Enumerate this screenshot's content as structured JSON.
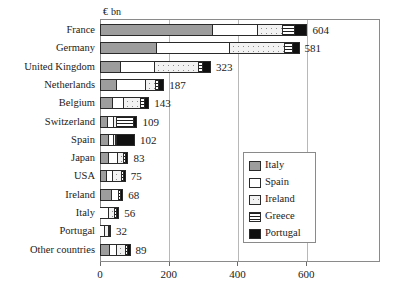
{
  "chart_data": {
    "type": "bar",
    "orientation": "horizontal",
    "stacked": true,
    "title": "",
    "units_label": "€ bn",
    "xlabel": "",
    "ylabel": "",
    "xlim": [
      0,
      815
    ],
    "xticks": [
      0,
      200,
      400,
      600
    ],
    "xtick_labels": [
      "0",
      "200",
      "400",
      "600"
    ],
    "grid": "vertical",
    "legend_position": "right-middle",
    "categories": [
      "France",
      "Germany",
      "United Kingdom",
      "Netherlands",
      "Belgium",
      "Switzerland",
      "Spain",
      "Japan",
      "USA",
      "Ireland",
      "Italy",
      "Portugal",
      "Other countries"
    ],
    "totals": [
      604,
      581,
      323,
      187,
      143,
      109,
      102,
      83,
      75,
      68,
      56,
      32,
      89
    ],
    "total_labels": [
      "604",
      "581",
      "323",
      "187",
      "143",
      "109",
      "102",
      "83",
      "75",
      "68",
      "56",
      "32",
      "89"
    ],
    "series": [
      {
        "name": "Italy",
        "fill": "solid-grey",
        "color": "#9d9d9d",
        "values": [
          330,
          166,
          62,
          50,
          37,
          23,
          27,
          27,
          19,
          36,
          0,
          0,
          29
        ]
      },
      {
        "name": "Spain",
        "fill": "white",
        "color": "#ffffff",
        "values": [
          130,
          212,
          97,
          85,
          32,
          19,
          14,
          26,
          19,
          20,
          25,
          14,
          20
        ]
      },
      {
        "name": "Ireland",
        "fill": "dotted",
        "color": "#f2f2f2",
        "values": [
          73,
          160,
          128,
          28,
          49,
          8,
          5,
          18,
          26,
          0,
          18,
          13,
          26
        ]
      },
      {
        "name": "Greece",
        "fill": "horizontal-stripes",
        "color": "#ffffff",
        "values": [
          36,
          23,
          12,
          9,
          12,
          50,
          5,
          6,
          6,
          5,
          6,
          3,
          8
        ]
      },
      {
        "name": "Portugal",
        "fill": "solid-black",
        "color": "#101010",
        "values": [
          35,
          20,
          24,
          15,
          13,
          9,
          51,
          6,
          5,
          7,
          7,
          2,
          6
        ]
      }
    ]
  },
  "legend": {
    "items": [
      {
        "label": "Italy"
      },
      {
        "label": "Spain"
      },
      {
        "label": "Ireland"
      },
      {
        "label": "Greece"
      },
      {
        "label": "Portugal"
      }
    ]
  }
}
